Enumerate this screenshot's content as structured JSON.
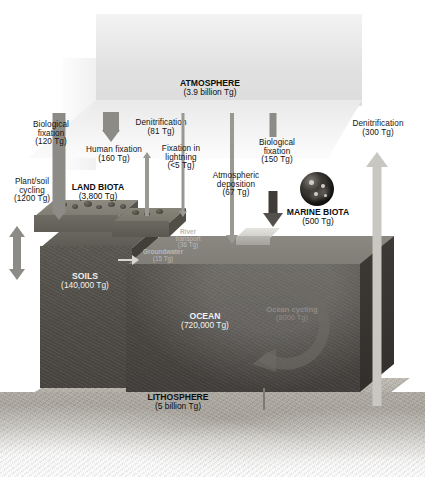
{
  "diagram": {
    "units": "Tg",
    "palette": {
      "background": "#ffffff",
      "atmosphere": "#e9e9e9",
      "ocean": "#4a4743",
      "soils": "#4f4c47",
      "lithosphere": "#aca89f",
      "arrow": "#8d8b86",
      "text": "#141414",
      "faint_text": "#b9b9b9"
    }
  },
  "reservoirs": [
    {
      "id": "atmosphere",
      "name": "ATMOSPHERE",
      "amount": "(3.9 billion Tg)",
      "value": 3900000000.0
    },
    {
      "id": "land_biota",
      "name": "LAND BIOTA",
      "amount": "(3,800 Tg)",
      "value": 3800
    },
    {
      "id": "soils",
      "name": "SOILS",
      "amount": "(140,000 Tg)",
      "value": 140000
    },
    {
      "id": "marine_biota",
      "name": "MARINE BIOTA",
      "amount": "(500 Tg)",
      "value": 500
    },
    {
      "id": "ocean",
      "name": "OCEAN",
      "amount": "(720,000 Tg)",
      "value": 720000
    },
    {
      "id": "lithosphere",
      "name": "LITHOSPHERE",
      "amount": "(5 billion Tg)",
      "value": 5000000000.0
    }
  ],
  "fluxes": [
    {
      "id": "bio_fix_land",
      "name": "Biological",
      "name2": "fixation",
      "amount": "(120 Tg)",
      "value": 120,
      "direction": "down"
    },
    {
      "id": "human_fix",
      "name": "Human fixation",
      "name2": "",
      "amount": "(160 Tg)",
      "value": 160,
      "direction": "down"
    },
    {
      "id": "denit_land",
      "name": "Denitrification",
      "name2": "",
      "amount": "(81 Tg)",
      "value": 81,
      "direction": "up"
    },
    {
      "id": "lightning_fix",
      "name": "Fixation in",
      "name2": "lightning",
      "amount": "(<5 Tg)",
      "value": 5,
      "direction": "down"
    },
    {
      "id": "atm_dep",
      "name": "Atmospheric",
      "name2": "deposition",
      "amount": "(67 Tg)",
      "value": 67,
      "direction": "down"
    },
    {
      "id": "bio_fix_ocean",
      "name": "Biological",
      "name2": "fixation",
      "amount": "(150 Tg)",
      "value": 150,
      "direction": "down"
    },
    {
      "id": "denit_ocean",
      "name": "Denitrification",
      "name2": "",
      "amount": "(300 Tg)",
      "value": 300,
      "direction": "up"
    },
    {
      "id": "plant_soil",
      "name": "Plant/soil",
      "name2": "cycling",
      "amount": "(1200 Tg)",
      "value": 1200,
      "direction": "both"
    }
  ],
  "internal_fluxes": [
    {
      "id": "river_transport",
      "name": "River",
      "name2": "transport",
      "amount": "(36 Tg)",
      "value": 36
    },
    {
      "id": "groundwater",
      "name": "Groundwater",
      "name2": "",
      "amount": "(15 Tg)",
      "value": 15
    },
    {
      "id": "ocean_cycling",
      "name": "Ocean cycling",
      "name2": "",
      "amount": "(8000 Tg)",
      "value": 8000
    }
  ]
}
